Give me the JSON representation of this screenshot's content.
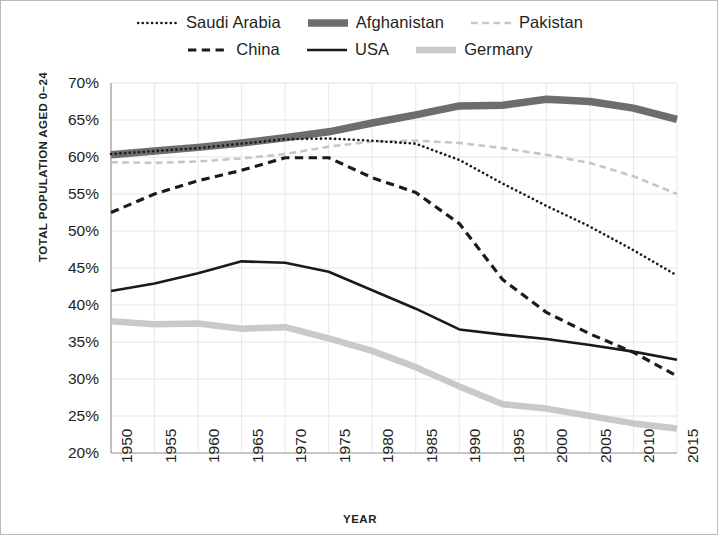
{
  "chart_data": {
    "type": "line",
    "title": "",
    "xlabel": "YEAR",
    "ylabel": "TOTAL POPULATION AGED 0–24",
    "xlim": [
      1950,
      2015
    ],
    "ylim": [
      20,
      70
    ],
    "ytick_labels": [
      "70%",
      "65%",
      "60%",
      "55%",
      "50%",
      "45%",
      "40%",
      "35%",
      "30%",
      "25%",
      "20%"
    ],
    "ytick_values": [
      70,
      65,
      60,
      55,
      50,
      45,
      40,
      35,
      30,
      25,
      20
    ],
    "x": [
      1950,
      1955,
      1960,
      1965,
      1970,
      1975,
      1980,
      1985,
      1990,
      1995,
      2000,
      2005,
      2010,
      2015
    ],
    "categories": [
      "1950",
      "1955",
      "1960",
      "1965",
      "1970",
      "1975",
      "1980",
      "1985",
      "1990",
      "1995",
      "2000",
      "2005",
      "2010",
      "2015"
    ],
    "grid": true,
    "legend_position": "top",
    "series": [
      {
        "name": "Saudi Arabia",
        "style": "dotted",
        "color": "#1a1a1a",
        "width": 2.6,
        "values": [
          60.4,
          60.8,
          61.2,
          61.8,
          62.4,
          62.5,
          62.2,
          61.8,
          59.6,
          56.4,
          53.4,
          50.6,
          47.4,
          44.0
        ]
      },
      {
        "name": "Afghanistan",
        "style": "solid",
        "color": "#6d6d6d",
        "width": 7.5,
        "values": [
          60.3,
          60.8,
          61.3,
          61.9,
          62.6,
          63.4,
          64.6,
          65.7,
          66.9,
          67.0,
          67.8,
          67.5,
          66.6,
          65.1
        ]
      },
      {
        "name": "Pakistan",
        "style": "dashed",
        "color": "#c6c6c6",
        "width": 2.6,
        "values": [
          59.3,
          59.2,
          59.4,
          59.8,
          60.4,
          61.4,
          62.1,
          62.2,
          61.9,
          61.2,
          60.3,
          59.2,
          57.4,
          55.0
        ]
      },
      {
        "name": "China",
        "style": "dashed",
        "color": "#1a1a1a",
        "width": 3.2,
        "values": [
          52.5,
          55.0,
          56.8,
          58.2,
          59.9,
          59.9,
          57.2,
          55.2,
          51.0,
          43.4,
          39.0,
          36.1,
          33.6,
          30.4
        ]
      },
      {
        "name": "USA",
        "style": "solid",
        "color": "#1a1a1a",
        "width": 2.6,
        "values": [
          41.9,
          42.9,
          44.3,
          45.9,
          45.7,
          44.5,
          42.0,
          39.5,
          36.7,
          36.0,
          35.4,
          34.6,
          33.7,
          32.6
        ]
      },
      {
        "name": "Germany",
        "style": "solid",
        "color": "#c9c9c9",
        "width": 6.5,
        "values": [
          37.8,
          37.4,
          37.5,
          36.8,
          37.0,
          35.5,
          33.8,
          31.6,
          29.0,
          26.6,
          26.0,
          25.0,
          24.0,
          23.3
        ]
      }
    ]
  },
  "legend": {
    "rows": [
      [
        {
          "label": "Saudi Arabia",
          "series": 0
        },
        {
          "label": "Afghanistan",
          "series": 1
        },
        {
          "label": "Pakistan",
          "series": 2
        }
      ],
      [
        {
          "label": "China",
          "series": 3
        },
        {
          "label": "USA",
          "series": 4
        },
        {
          "label": "Germany",
          "series": 5
        }
      ]
    ]
  }
}
